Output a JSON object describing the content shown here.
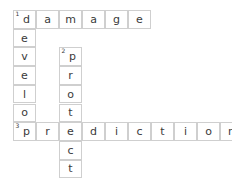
{
  "puzzle": {
    "type": "crossword",
    "grid": {
      "origin_x": 13,
      "origin_y": 10,
      "cell_width": 23,
      "cell_height": 18.7,
      "columns": 10,
      "rows": 9,
      "border_color": "#cfcfcf",
      "text_color": "#3a3a3a",
      "background_color": "#ffffff"
    },
    "entries": [
      {
        "number": "1",
        "direction": "across",
        "answer": "damage",
        "row": 0,
        "col": 0,
        "length": 6,
        "letters": [
          "d",
          "a",
          "m",
          "a",
          "g",
          "e"
        ]
      },
      {
        "number": "1",
        "direction": "down",
        "answer": "develop",
        "row": 0,
        "col": 0,
        "length": 7,
        "letters": [
          "d",
          "e",
          "v",
          "e",
          "l",
          "o",
          "p"
        ]
      },
      {
        "number": "2",
        "direction": "down",
        "answer": "protect",
        "row": 2,
        "col": 2,
        "length": 7,
        "letters": [
          "p",
          "r",
          "o",
          "t",
          "e",
          "c",
          "t"
        ]
      },
      {
        "number": "3",
        "direction": "across",
        "answer": "prediction",
        "row": 6,
        "col": 0,
        "length": 10,
        "letters": [
          "p",
          "r",
          "e",
          "d",
          "i",
          "c",
          "t",
          "i",
          "o",
          "n"
        ]
      }
    ],
    "cells": [
      {
        "row": 0,
        "col": 0,
        "letter": "d",
        "number": "1"
      },
      {
        "row": 0,
        "col": 1,
        "letter": "a",
        "number": ""
      },
      {
        "row": 0,
        "col": 2,
        "letter": "m",
        "number": ""
      },
      {
        "row": 0,
        "col": 3,
        "letter": "a",
        "number": ""
      },
      {
        "row": 0,
        "col": 4,
        "letter": "g",
        "number": ""
      },
      {
        "row": 0,
        "col": 5,
        "letter": "e",
        "number": ""
      },
      {
        "row": 1,
        "col": 0,
        "letter": "e",
        "number": ""
      },
      {
        "row": 2,
        "col": 0,
        "letter": "v",
        "number": ""
      },
      {
        "row": 2,
        "col": 2,
        "letter": "p",
        "number": "2"
      },
      {
        "row": 3,
        "col": 0,
        "letter": "e",
        "number": ""
      },
      {
        "row": 3,
        "col": 2,
        "letter": "r",
        "number": ""
      },
      {
        "row": 4,
        "col": 0,
        "letter": "l",
        "number": ""
      },
      {
        "row": 4,
        "col": 2,
        "letter": "o",
        "number": ""
      },
      {
        "row": 5,
        "col": 0,
        "letter": "o",
        "number": ""
      },
      {
        "row": 5,
        "col": 2,
        "letter": "t",
        "number": ""
      },
      {
        "row": 6,
        "col": 0,
        "letter": "p",
        "number": "3"
      },
      {
        "row": 6,
        "col": 1,
        "letter": "r",
        "number": ""
      },
      {
        "row": 6,
        "col": 2,
        "letter": "e",
        "number": ""
      },
      {
        "row": 6,
        "col": 3,
        "letter": "d",
        "number": ""
      },
      {
        "row": 6,
        "col": 4,
        "letter": "i",
        "number": ""
      },
      {
        "row": 6,
        "col": 5,
        "letter": "c",
        "number": ""
      },
      {
        "row": 6,
        "col": 6,
        "letter": "t",
        "number": ""
      },
      {
        "row": 6,
        "col": 7,
        "letter": "i",
        "number": ""
      },
      {
        "row": 6,
        "col": 8,
        "letter": "o",
        "number": ""
      },
      {
        "row": 6,
        "col": 9,
        "letter": "n",
        "number": ""
      },
      {
        "row": 7,
        "col": 2,
        "letter": "c",
        "number": ""
      },
      {
        "row": 8,
        "col": 2,
        "letter": "t",
        "number": ""
      }
    ]
  }
}
